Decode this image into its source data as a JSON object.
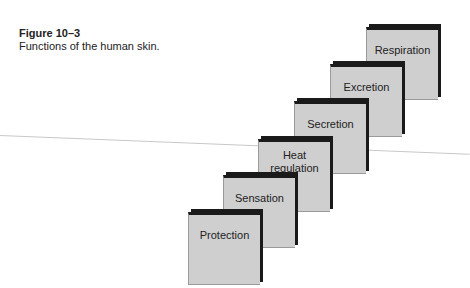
{
  "caption": {
    "figure_number": "Figure 10–3",
    "title": "Functions of the human skin."
  },
  "diagram": {
    "type": "staircase",
    "steps": [
      {
        "label": "Protection",
        "x": 188,
        "y": 212
      },
      {
        "label": "Sensation",
        "x": 223,
        "y": 175
      },
      {
        "label": "Heat regulation",
        "x": 258,
        "y": 139
      },
      {
        "label": "Secretion",
        "x": 294,
        "y": 101
      },
      {
        "label": "Excretion",
        "x": 330,
        "y": 64
      },
      {
        "label": "Respiration",
        "x": 366,
        "y": 27
      }
    ],
    "colors": {
      "face": "#cfcfcf",
      "edge": "#1a1a1a"
    }
  }
}
